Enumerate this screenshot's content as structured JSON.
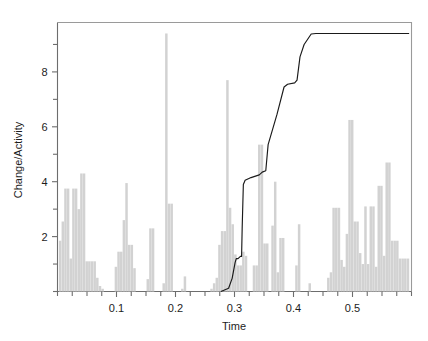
{
  "chart_data": {
    "type": "bar",
    "title": "",
    "subtitle": "",
    "xlabel": "Time",
    "ylabel": "Change/Activity",
    "xlim": [
      0.0,
      0.6
    ],
    "ylim": [
      0.0,
      9.8
    ],
    "grid": false,
    "legend": null,
    "x_ticks_major": [
      0.1,
      0.2,
      0.3,
      0.4,
      0.5
    ],
    "x_tick_labels": [
      "0.1",
      "0.2",
      "0.3",
      "0.4",
      "0.5"
    ],
    "x_ticks_minor": [
      0.0,
      0.025,
      0.05,
      0.075,
      0.125,
      0.15,
      0.175,
      0.225,
      0.25,
      0.275,
      0.325,
      0.35,
      0.375,
      0.425,
      0.45,
      0.475,
      0.525,
      0.55,
      0.575,
      0.6
    ],
    "y_ticks_major": [
      2,
      4,
      6,
      8
    ],
    "y_tick_labels": [
      "2",
      "4",
      "6",
      "8"
    ],
    "y_ticks_minor": [
      0,
      1,
      3,
      5,
      7,
      9
    ],
    "bar_color": "#d2d2d2",
    "line_color": "#1a1a1a",
    "axis_color": "#6d6d6d",
    "frame_color": "#9a9a9a",
    "bar_width": 0.0042,
    "series": [
      {
        "name": "Change/Activity",
        "type": "bar",
        "x": [
          0.0045,
          0.009,
          0.0135,
          0.018,
          0.0225,
          0.027,
          0.0315,
          0.036,
          0.0405,
          0.045,
          0.0495,
          0.054,
          0.0585,
          0.063,
          0.0675,
          0.072,
          0.0765,
          0.099,
          0.1035,
          0.108,
          0.1125,
          0.117,
          0.1215,
          0.126,
          0.1305,
          0.153,
          0.1575,
          0.162,
          0.18,
          0.1845,
          0.189,
          0.1935,
          0.2115,
          0.216,
          0.261,
          0.2655,
          0.27,
          0.2745,
          0.279,
          0.2835,
          0.288,
          0.2925,
          0.297,
          0.3015,
          0.306,
          0.3105,
          0.315,
          0.3195,
          0.333,
          0.3375,
          0.342,
          0.3465,
          0.351,
          0.3555,
          0.3645,
          0.369,
          0.3735,
          0.378,
          0.3825,
          0.405,
          0.4095,
          0.4275,
          0.459,
          0.4635,
          0.468,
          0.4725,
          0.477,
          0.4815,
          0.486,
          0.4905,
          0.495,
          0.4995,
          0.504,
          0.5085,
          0.513,
          0.5175,
          0.522,
          0.5265,
          0.531,
          0.5355,
          0.54,
          0.5445,
          0.549,
          0.5535,
          0.558,
          0.5625,
          0.567,
          0.5715,
          0.576,
          0.5805,
          0.585,
          0.5895,
          0.594
        ],
        "values": [
          1.85,
          2.55,
          3.75,
          3.75,
          1.2,
          3.75,
          3.75,
          3.0,
          4.3,
          4.3,
          1.1,
          1.1,
          1.1,
          1.1,
          0.5,
          0.2,
          0.1,
          0.9,
          1.45,
          1.45,
          2.6,
          3.95,
          1.7,
          1.7,
          0.85,
          0.45,
          2.3,
          2.3,
          0.3,
          9.4,
          3.2,
          3.2,
          0.1,
          0.55,
          0.1,
          0.3,
          0.5,
          1.7,
          2.2,
          2.2,
          7.7,
          3.05,
          2.45,
          1.35,
          0.95,
          0.95,
          1.45,
          1.3,
          0.95,
          0.95,
          5.35,
          5.35,
          1.75,
          1.75,
          2.4,
          4.0,
          0.7,
          1.95,
          1.95,
          0.95,
          2.45,
          0.3,
          0.5,
          0.7,
          3.05,
          3.05,
          3.05,
          1.15,
          0.9,
          2.1,
          6.25,
          6.25,
          2.55,
          2.55,
          1.4,
          1.0,
          3.1,
          1.0,
          3.1,
          3.1,
          0.9,
          3.85,
          3.85,
          1.3,
          4.7,
          4.7,
          1.85,
          1.85,
          1.85,
          1.2,
          1.2,
          1.2,
          1.2
        ]
      },
      {
        "name": "Cumulative step",
        "type": "line",
        "points": [
          [
            0.277,
            0.0
          ],
          [
            0.29,
            0.12
          ],
          [
            0.296,
            0.48
          ],
          [
            0.301,
            1.05
          ],
          [
            0.303,
            1.2
          ],
          [
            0.306,
            1.2
          ],
          [
            0.31,
            1.28
          ],
          [
            0.312,
            1.28
          ],
          [
            0.313,
            2.3
          ],
          [
            0.315,
            3.9
          ],
          [
            0.318,
            4.05
          ],
          [
            0.328,
            4.15
          ],
          [
            0.342,
            4.25
          ],
          [
            0.347,
            4.35
          ],
          [
            0.353,
            4.4
          ],
          [
            0.357,
            5.35
          ],
          [
            0.372,
            6.45
          ],
          [
            0.384,
            7.45
          ],
          [
            0.39,
            7.55
          ],
          [
            0.402,
            7.6
          ],
          [
            0.406,
            7.7
          ],
          [
            0.411,
            8.55
          ],
          [
            0.418,
            9.0
          ],
          [
            0.43,
            9.38
          ],
          [
            0.438,
            9.4
          ],
          [
            0.596,
            9.4
          ]
        ]
      }
    ]
  },
  "axes": {
    "x_title": "Time",
    "y_title": "Change/Activity"
  }
}
